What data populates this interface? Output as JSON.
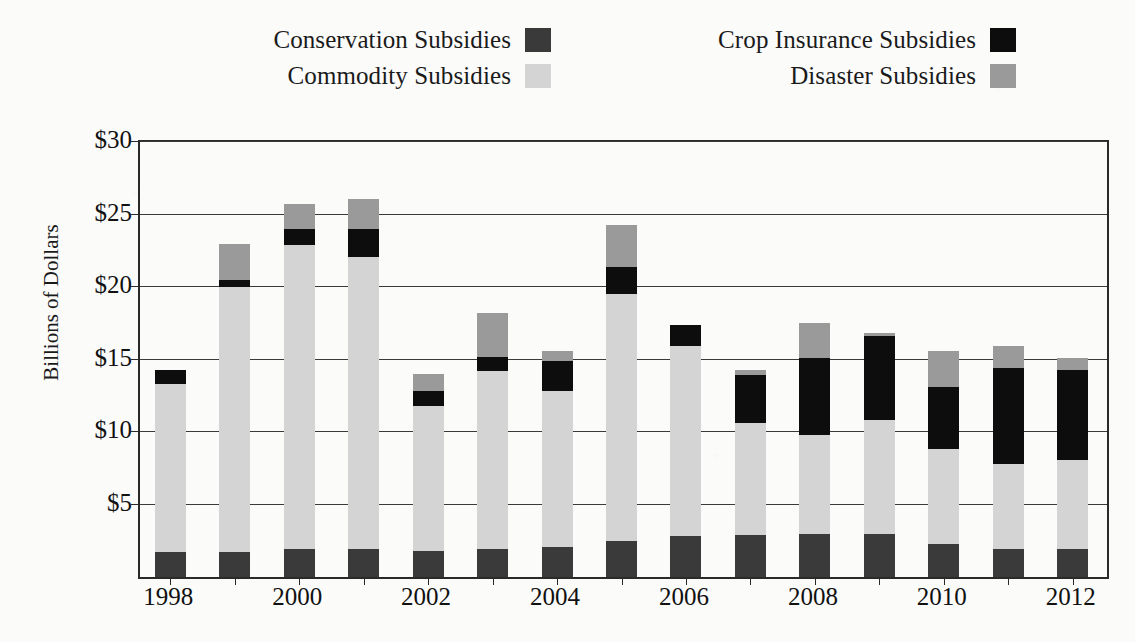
{
  "chart_data": {
    "type": "bar",
    "subtype": "stacked-bar",
    "title": "",
    "xlabel": "",
    "ylabel": "Billions of Dollars",
    "x": [
      1998,
      1999,
      2000,
      2001,
      2002,
      2003,
      2004,
      2005,
      2006,
      2007,
      2008,
      2009,
      2010,
      2011,
      2012
    ],
    "categories": [
      "1998",
      "1999",
      "2000",
      "2001",
      "2002",
      "2003",
      "2004",
      "2005",
      "2006",
      "2007",
      "2008",
      "2009",
      "2010",
      "2011",
      "2012"
    ],
    "xtick_labels": [
      "1998",
      "2000",
      "2002",
      "2004",
      "2006",
      "2008",
      "2010",
      "2012"
    ],
    "ytick_labels": [
      "$5",
      "$10",
      "$15",
      "$20",
      "$25",
      "$30"
    ],
    "ytick_values": [
      5,
      10,
      15,
      20,
      25,
      30
    ],
    "ylim": [
      0,
      30
    ],
    "grid": "horizontal",
    "legend_position": "top",
    "stack_order": [
      "Conservation Subsidies",
      "Commodity Subsidies",
      "Crop Insurance Subsidies",
      "Disaster Subsidies"
    ],
    "series": [
      {
        "name": "Conservation Subsidies",
        "color": "#3a3a3a",
        "values": [
          1.7,
          1.7,
          1.9,
          1.9,
          1.8,
          1.9,
          2.1,
          2.5,
          2.8,
          2.9,
          3.0,
          3.0,
          2.3,
          1.9,
          1.9
        ]
      },
      {
        "name": "Commodity Subsidies",
        "color": "#d4d4d4",
        "values": [
          11.6,
          18.3,
          21.0,
          20.2,
          10.0,
          12.3,
          10.7,
          17.0,
          13.1,
          7.7,
          6.8,
          7.8,
          6.5,
          5.9,
          6.2
        ]
      },
      {
        "name": "Crop Insurance Subsidies",
        "color": "#0d0d0d",
        "values": [
          1.0,
          0.5,
          1.1,
          1.9,
          1.0,
          1.0,
          2.1,
          1.9,
          1.5,
          3.3,
          5.3,
          5.8,
          4.3,
          6.6,
          6.2
        ]
      },
      {
        "name": "Disaster Subsidies",
        "color": "#9a9a9a",
        "values": [
          0.0,
          2.5,
          1.7,
          2.1,
          1.2,
          3.0,
          0.7,
          2.9,
          0.0,
          0.4,
          2.4,
          0.2,
          2.5,
          1.5,
          0.8
        ]
      }
    ],
    "totals": [
      14.3,
      23.0,
      25.7,
      26.1,
      14.0,
      18.2,
      15.6,
      24.3,
      17.4,
      14.3,
      17.5,
      16.8,
      15.6,
      15.9,
      15.1
    ]
  },
  "legend": {
    "rows": [
      {
        "left": {
          "label": "Conservation Subsidies",
          "color": "#3a3a3a",
          "swatch_name": "legend-swatch-conservation"
        },
        "right": {
          "label": "Crop Insurance Subsidies",
          "color": "#0d0d0d",
          "swatch_name": "legend-swatch-crop-insurance"
        }
      },
      {
        "left": {
          "label": "Commodity Subsidies",
          "color": "#d4d4d4",
          "swatch_name": "legend-swatch-commodity"
        },
        "right": {
          "label": "Disaster Subsidies",
          "color": "#9a9a9a",
          "swatch_name": "legend-swatch-disaster"
        }
      }
    ]
  },
  "axes": {
    "y_title": "Billions of Dollars",
    "y_ticks": [
      "$30",
      "$25",
      "$20",
      "$15",
      "$10",
      "$5"
    ],
    "x_ticks": [
      "1998",
      "2000",
      "2002",
      "2004",
      "2006",
      "2008",
      "2010",
      "2012"
    ]
  },
  "colors": {
    "conservation": "#3a3a3a",
    "commodity": "#d4d4d4",
    "crop_insurance": "#0d0d0d",
    "disaster": "#9a9a9a",
    "axis": "#2a2a2a",
    "grid": "#3a3a3a",
    "background": "#fbfbfa"
  }
}
